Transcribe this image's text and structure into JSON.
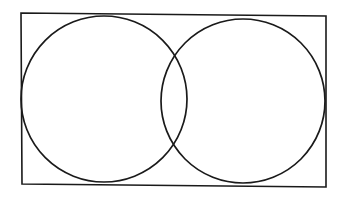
{
  "diagram": {
    "type": "venn",
    "background": "#ffffff",
    "stroke_color": "#1a1a1a",
    "frame": {
      "points": "21,13 326,16 326,187 22,184",
      "stroke_width": 1.6
    },
    "circles": [
      {
        "name": "left-set",
        "cx": 104,
        "cy": 99,
        "r": 83,
        "stroke_width": 1.7
      },
      {
        "name": "right-set",
        "cx": 243,
        "cy": 101,
        "r": 82,
        "stroke_width": 1.7
      }
    ]
  }
}
